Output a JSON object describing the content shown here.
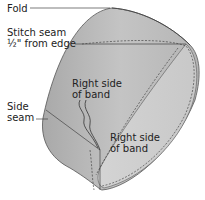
{
  "diagram": {
    "labels": {
      "fold": "Fold",
      "stitch_seam_line1": "Stitch seam",
      "stitch_seam_line2": "½\" from edge",
      "right_side_outer_line1": "Right side",
      "right_side_outer_line2": "of band",
      "side_seam_line1": "Side",
      "side_seam_line2": "seam",
      "right_side_inner_line1": "Right side",
      "right_side_inner_line2": "of band"
    },
    "colors": {
      "band_outer": "#b8b8b8",
      "band_inner": "#d6d6d6",
      "band_edge": "#9a9a9a",
      "outline": "#444444",
      "text": "#222222",
      "background": "#ffffff"
    }
  }
}
